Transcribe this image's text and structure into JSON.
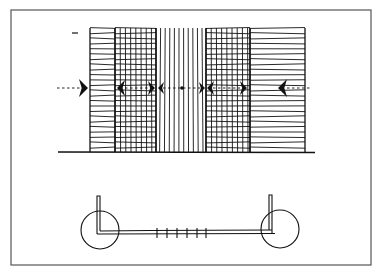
{
  "figure": {
    "type": "architectural-sketch",
    "frame": {
      "x": 11,
      "y": 10,
      "width": 360,
      "height": 255,
      "stroke": "#555555"
    },
    "ink_color": "#111111",
    "top_view": {
      "name": "facade-elevation",
      "top": 28,
      "bottom": 152,
      "ground_line": {
        "x1": 58,
        "x2": 315,
        "y": 152
      },
      "top_left_mark": {
        "x1": 72,
        "x2": 78,
        "y": 33
      },
      "sections": [
        {
          "name": "hatched-left",
          "x1": 90,
          "x2": 115,
          "pattern": "horizontal",
          "spacing": 5.2
        },
        {
          "name": "grid-left",
          "x1": 115,
          "x2": 156,
          "pattern": "grid",
          "spacing_h": 5.2,
          "spacing_v": 5.2
        },
        {
          "name": "vertical-strip",
          "x1": 156,
          "x2": 206,
          "pattern": "vertical",
          "spacing": 4.6
        },
        {
          "name": "grid-right",
          "x1": 206,
          "x2": 250,
          "pattern": "grid",
          "spacing_h": 5.2,
          "spacing_v": 5.2
        },
        {
          "name": "hatched-right",
          "x1": 250,
          "x2": 305,
          "pattern": "horizontal",
          "spacing": 5.2
        }
      ],
      "arrow_axis_y": 88,
      "arrows": [
        {
          "name": "outer-left-arrow",
          "tip_x": 88,
          "dir": "right",
          "size": 9
        },
        {
          "name": "grid-left-arrow-a",
          "tip_x": 117,
          "dir": "left",
          "size": 8
        },
        {
          "name": "grid-left-arrow-b",
          "tip_x": 155,
          "dir": "right",
          "size": 7
        },
        {
          "name": "strip-arrow-left",
          "tip_x": 158,
          "dir": "left",
          "size": 6
        },
        {
          "name": "strip-arrow-right",
          "tip_x": 205,
          "dir": "right",
          "size": 6
        },
        {
          "name": "grid-right-arrow-a",
          "tip_x": 207,
          "dir": "left",
          "size": 7
        },
        {
          "name": "grid-right-arrow-b",
          "tip_x": 247,
          "dir": "right",
          "size": 7
        },
        {
          "name": "outer-right-arrow",
          "tip_x": 278,
          "dir": "left",
          "size": 9
        }
      ],
      "dashed_lines": [
        {
          "x1": 57,
          "x2": 80
        },
        {
          "x1": 125,
          "x2": 150
        },
        {
          "x1": 163,
          "x2": 200
        },
        {
          "x1": 213,
          "x2": 240
        },
        {
          "x1": 287,
          "x2": 310
        }
      ],
      "center_dot": {
        "x": 182,
        "y": 88,
        "r": 1.8
      }
    },
    "bottom_view": {
      "name": "section-plan",
      "left_circle": {
        "cx": 100,
        "cy": 230,
        "r": 19
      },
      "right_circle": {
        "cx": 280,
        "cy": 229,
        "r": 19
      },
      "beam": {
        "x1": 97,
        "x2": 272,
        "y_top": 231,
        "y_bottom": 234
      },
      "left_post": {
        "x": 97,
        "width": 3,
        "y_top": 196,
        "y_bottom": 234
      },
      "right_post": {
        "x": 269,
        "width": 3,
        "y_top": 195,
        "y_bottom": 234
      },
      "ticks": [
        157,
        167,
        177,
        187,
        197,
        206
      ],
      "tick_y1": 228,
      "tick_y2": 238
    }
  }
}
